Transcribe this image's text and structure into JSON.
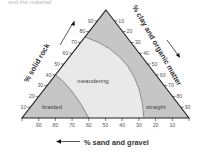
{
  "diagram": {
    "type": "ternary",
    "top_caption_fragment": "and the material",
    "axes": {
      "left": {
        "title": "% solid rock",
        "ticks": [
          "10",
          "20",
          "30",
          "40",
          "50",
          "60",
          "70",
          "80",
          "90"
        ]
      },
      "right": {
        "title": "% clay and organic matter",
        "ticks": [
          "10",
          "20",
          "30",
          "40",
          "50",
          "60",
          "70",
          "80",
          "90"
        ]
      },
      "bottom": {
        "title": "% sand and gravel",
        "ticks": [
          "90",
          "80",
          "70",
          "60",
          "50",
          "40",
          "30",
          "20",
          "10"
        ]
      }
    },
    "regions": [
      {
        "name": "braided",
        "label": "braided",
        "color": "#c6c6c6"
      },
      {
        "name": "meandering",
        "label": "meandering",
        "color": "#e9e9e9"
      },
      {
        "name": "straight",
        "label": "straight",
        "color": "#c6c6c6"
      }
    ],
    "boundaries": {
      "braided_meandering": {
        "left_axis_solid_rock": 40,
        "bottom_axis_sand_gravel": 60
      },
      "meandering_straight": {
        "left_axis_solid_rock": 75,
        "bottom_axis_sand_gravel": 27
      }
    },
    "colors": {
      "outline": "#222222",
      "boundary": "#777777",
      "arrow": "#111111"
    }
  }
}
